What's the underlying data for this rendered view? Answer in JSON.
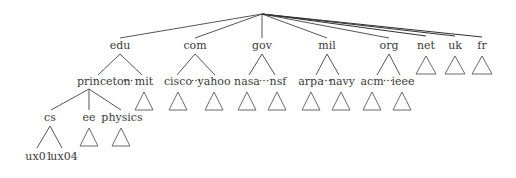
{
  "diagram": {
    "type": "tree",
    "colors": {
      "text": "#3a3a3a",
      "edges": "#555555",
      "subtree_triangles": "#6a6a6a",
      "background": "#ffffff"
    },
    "root": {
      "label": "",
      "x": 262,
      "y": 14
    },
    "top_level_domains": [
      {
        "label": "edu",
        "x": 120,
        "y": 50,
        "children_label": {
          "left": "princeton",
          "dots": "···",
          "right": "mit"
        }
      },
      {
        "label": "com",
        "x": 195,
        "y": 50,
        "children_label": {
          "left": "cisco",
          "dots": "···",
          "right": "yahoo"
        }
      },
      {
        "label": "gov",
        "x": 262,
        "y": 50,
        "children_label": {
          "left": "nasa",
          "dots": "···",
          "right": "nsf"
        }
      },
      {
        "label": "mil",
        "x": 327,
        "y": 50,
        "children_label": {
          "left": "arpa",
          "dots": "···",
          "right": "navy"
        }
      },
      {
        "label": "org",
        "x": 389,
        "y": 50,
        "children_label": {
          "left": "acm",
          "dots": "···",
          "right": "ieee"
        }
      },
      {
        "label": "net",
        "x": 426,
        "y": 50,
        "collapsed": true
      },
      {
        "label": "uk",
        "x": 455,
        "y": 50,
        "collapsed": true
      },
      {
        "label": "fr",
        "x": 482,
        "y": 50,
        "collapsed": true
      }
    ],
    "princeton_children": [
      {
        "label": "cs",
        "x": 51
      },
      {
        "label": "ee",
        "x": 90,
        "collapsed": true
      },
      {
        "label": "physics",
        "x": 122,
        "collapsed": true
      }
    ],
    "cs_children": [
      {
        "label": "ux01"
      },
      {
        "label": "ux04"
      }
    ],
    "collapsed_second_level": [
      "mit",
      "cisco",
      "yahoo",
      "nasa",
      "nsf",
      "arpa",
      "navy",
      "acm",
      "ieee"
    ]
  },
  "labels": {
    "edu": "edu",
    "com": "com",
    "gov": "gov",
    "mil": "mil",
    "org": "org",
    "net": "net",
    "uk": "uk",
    "fr": "fr",
    "princeton": "princeton",
    "mit": "mit",
    "cisco": "cisco",
    "yahoo": "yahoo",
    "nasa": "nasa",
    "nsf": "nsf",
    "arpa": "arpa",
    "navy": "navy",
    "acm": "acm",
    "ieee": "ieee",
    "dots": "···",
    "cs": "cs",
    "ee": "ee",
    "physics": "physics",
    "ux01": "ux01",
    "ux04": "ux04"
  }
}
